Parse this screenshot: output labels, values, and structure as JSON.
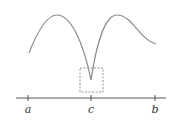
{
  "diagram": {
    "axis": {
      "labels": [
        {
          "id": "a",
          "text": "a",
          "x": 28
        },
        {
          "id": "c",
          "text": "c",
          "x": 91
        },
        {
          "id": "b",
          "text": "b",
          "x": 155
        }
      ]
    },
    "curve": {
      "color": "#8a8a8a",
      "points": {
        "start": [
          29,
          53
        ],
        "peak_left": [
          57,
          15
        ],
        "cusp": [
          91,
          80
        ],
        "peak_right": [
          117,
          15
        ],
        "end": [
          156,
          44
        ]
      }
    },
    "highlight_box": {
      "style": "dashed",
      "x": 80,
      "y": 68,
      "width": 23,
      "height": 24,
      "color": "#777777"
    },
    "axis_color": "#555555"
  }
}
